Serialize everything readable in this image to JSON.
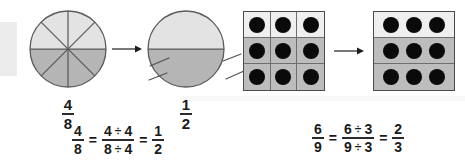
{
  "figure": {
    "background_color": "#ffffff"
  },
  "colors": {
    "light_fill": "#e2e2e2",
    "dark_fill": "#b4b4b4",
    "cell_light": "#efefef",
    "cell_shaded": "#bdbdbd",
    "dot": "#0a0a0a",
    "outline": "#5c5c5c",
    "grid_outline": "#4a4a4a",
    "text": "#1a1a1a",
    "artifact": "#ececed"
  },
  "left_example": {
    "source_model": {
      "shape": "circle",
      "total_parts": 8,
      "shaded_parts": 4,
      "shaded_half": "bottom"
    },
    "source_label": {
      "numerator": "4",
      "denominator": "8"
    },
    "arrow": {
      "direction": "right",
      "glyph": "arrow-right"
    },
    "result_model": {
      "shape": "circle",
      "total_parts": 2,
      "shaded_parts": 1,
      "shaded_half": "bottom",
      "erased_line_fragments": 4
    },
    "result_label": {
      "numerator": "1",
      "denominator": "2"
    },
    "equation": {
      "left": {
        "numerator": "4",
        "denominator": "8"
      },
      "equals_1": "=",
      "middle": {
        "numerator_expr": {
          "value": "4",
          "operator": "÷",
          "divisor": "4"
        },
        "denominator_expr": {
          "value": "8",
          "operator": "÷",
          "divisor": "4"
        }
      },
      "equals_2": "=",
      "right": {
        "numerator": "1",
        "denominator": "2"
      }
    }
  },
  "right_example": {
    "source_model": {
      "shape": "grid",
      "rows": 3,
      "columns": 3,
      "total_cells": 9,
      "shaded_cells": 6,
      "shaded_rows": [
        2,
        3
      ],
      "dots_per_cell": 1,
      "total_dots": 9
    },
    "arrow": {
      "direction": "right",
      "glyph": "arrow-right"
    },
    "result_model": {
      "shape": "grid",
      "rows": 3,
      "columns": 1,
      "total_bands": 3,
      "shaded_bands": 2,
      "shaded_rows": [
        2,
        3
      ],
      "dots_per_band": 3,
      "total_dots": 9
    },
    "equation": {
      "left": {
        "numerator": "6",
        "denominator": "9"
      },
      "equals_1": "=",
      "middle": {
        "numerator_expr": {
          "value": "6",
          "operator": "÷",
          "divisor": "3"
        },
        "denominator_expr": {
          "value": "9",
          "operator": "÷",
          "divisor": "3"
        }
      },
      "equals_2": "=",
      "right": {
        "numerator": "2",
        "denominator": "3"
      }
    }
  }
}
